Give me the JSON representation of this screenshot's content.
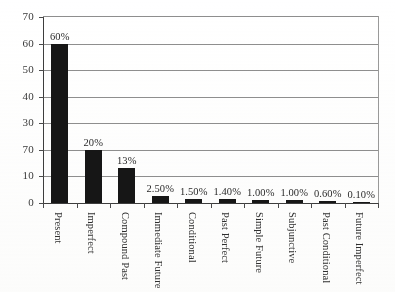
{
  "chart_data": {
    "type": "bar",
    "title": "",
    "xlabel": "",
    "ylabel": "",
    "ylim": [
      0,
      70
    ],
    "y_ticks": [
      0,
      10,
      20,
      30,
      40,
      50,
      60,
      70
    ],
    "y_tick_labels": [
      "0",
      "10",
      "70",
      "30",
      "40",
      "50",
      "60",
      "70"
    ],
    "grid": true,
    "legend": "none",
    "orientation": "vertical",
    "bar_color": "#161616",
    "gridline_color": "#8f8f8f",
    "axis_color": "#3d3d3d",
    "categories": [
      "Present",
      "Imperfect",
      "Compound Past",
      "Immediate Future",
      "Conditional",
      "Past Perfect",
      "Simple Future",
      "Subjunctive",
      "Past Conditional",
      "Future Imperfect"
    ],
    "values": [
      60,
      20,
      13,
      2.5,
      1.5,
      1.4,
      1.0,
      1.0,
      0.6,
      0.1
    ],
    "data_labels": [
      "60%",
      "20%",
      "13%",
      "2.50%",
      "1.50%",
      "1.40%",
      "1.00%",
      "1.00%",
      "0.60%",
      "0.10%"
    ]
  }
}
